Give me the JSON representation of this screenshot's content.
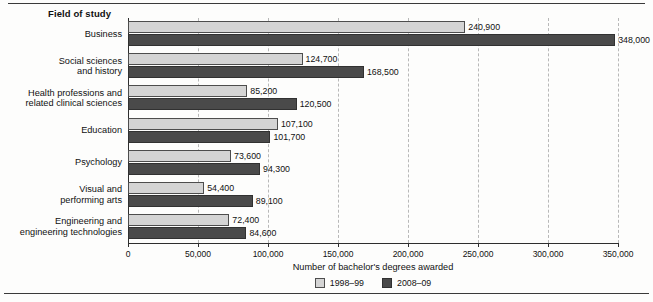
{
  "figure": {
    "axis_group_title": "Field of study",
    "xaxis_title": "Number of bachelor's degrees awarded"
  },
  "legend": {
    "items": [
      {
        "label": "1998–99",
        "color": "#d4d4d4"
      },
      {
        "label": "2008–09",
        "color": "#4a4a4a"
      }
    ]
  },
  "chart_data": {
    "type": "bar",
    "orientation": "horizontal",
    "title": "",
    "xlabel": "Number of bachelor's degrees awarded",
    "ylabel": "Field of study",
    "xlim": [
      0,
      350000
    ],
    "grid": true,
    "legend_position": "bottom-center",
    "tick_labels": [
      "0",
      "50,000",
      "100,000",
      "150,000",
      "200,000",
      "250,000",
      "300,000",
      "350,000"
    ],
    "tick_values": [
      0,
      50000,
      100000,
      150000,
      200000,
      250000,
      300000,
      350000
    ],
    "categories": [
      "Business",
      "Social sciences and history",
      "Health professions and related clinical sciences",
      "Education",
      "Psychology",
      "Visual and performing arts",
      "Engineering and engineering technologies"
    ],
    "category_lines": [
      [
        "Business"
      ],
      [
        "Social sciences",
        "and history"
      ],
      [
        "Health professions and",
        "related clinical sciences"
      ],
      [
        "Education"
      ],
      [
        "Psychology"
      ],
      [
        "Visual and",
        "performing arts"
      ],
      [
        "Engineering and",
        "engineering technologies"
      ]
    ],
    "series": [
      {
        "name": "1998–99",
        "color": "#d4d4d4",
        "values": [
          240900,
          124700,
          85200,
          107100,
          73600,
          54400,
          72400
        ],
        "labels": [
          "240,900",
          "124,700",
          "85,200",
          "107,100",
          "73,600",
          "54,400",
          "72,400"
        ]
      },
      {
        "name": "2008–09",
        "color": "#4a4a4a",
        "values": [
          348000,
          168500,
          120500,
          101700,
          94300,
          89100,
          84600
        ],
        "labels": [
          "348,000",
          "168,500",
          "120,500",
          "101,700",
          "94,300",
          "89,100",
          "84,600"
        ]
      }
    ]
  }
}
